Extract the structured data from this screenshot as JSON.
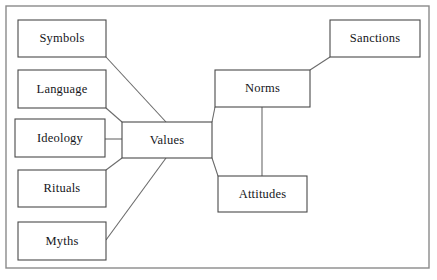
{
  "diagram": {
    "frame": {
      "name": "outer-border",
      "x": 6,
      "y": 6,
      "width": 423,
      "height": 262,
      "stroke": "#8a8a8a",
      "stroke_width": 1.4
    },
    "style": {
      "box_stroke": "#4a4a4a",
      "box_fill": "#ffffff",
      "box_stroke_width": 1.1,
      "connector_stroke": "#6b6b6b",
      "connector_stroke_width": 1.1,
      "text_color": "#15161a",
      "background": "#ffffff"
    },
    "nodes": [
      {
        "id": "symbols",
        "label": "Symbols",
        "x": 18,
        "y": 20,
        "width": 88,
        "height": 37
      },
      {
        "id": "language",
        "label": "Language",
        "x": 18,
        "y": 70,
        "width": 88,
        "height": 38
      },
      {
        "id": "ideology",
        "label": "Ideology",
        "x": 15,
        "y": 119,
        "width": 90,
        "height": 38
      },
      {
        "id": "rituals",
        "label": "Rituals",
        "x": 18,
        "y": 170,
        "width": 88,
        "height": 37
      },
      {
        "id": "myths",
        "label": "Myths",
        "x": 18,
        "y": 222,
        "width": 88,
        "height": 38
      },
      {
        "id": "values",
        "label": "Values",
        "x": 122,
        "y": 122,
        "width": 90,
        "height": 36
      },
      {
        "id": "norms",
        "label": "Norms",
        "x": 215,
        "y": 70,
        "width": 95,
        "height": 37
      },
      {
        "id": "sanctions",
        "label": "Sanctions",
        "x": 330,
        "y": 20,
        "width": 90,
        "height": 37
      },
      {
        "id": "attitudes",
        "label": "Attitudes",
        "x": 218,
        "y": 176,
        "width": 89,
        "height": 36
      }
    ],
    "connectors": [
      {
        "id": "symbols-to-values",
        "from": "symbols",
        "to": "values",
        "points": "106,57 166,122"
      },
      {
        "id": "language-to-values",
        "from": "language",
        "to": "values",
        "points": "106,108 122,122"
      },
      {
        "id": "ideology-to-values",
        "from": "ideology",
        "to": "values",
        "points": "105,139 122,139"
      },
      {
        "id": "rituals-to-values",
        "from": "rituals",
        "to": "values",
        "points": "106,170 122,158"
      },
      {
        "id": "myths-to-values",
        "from": "myths",
        "to": "values",
        "points": "106,240 166,158"
      },
      {
        "id": "values-to-norms",
        "from": "values",
        "to": "norms",
        "points": "212,122 215,107"
      },
      {
        "id": "values-to-attitudes",
        "from": "values",
        "to": "attitudes",
        "points": "212,158 218,176"
      },
      {
        "id": "norms-to-sanctions",
        "from": "norms",
        "to": "sanctions",
        "points": "310,70 330,57"
      },
      {
        "id": "norms-to-attitudes",
        "from": "norms",
        "to": "attitudes",
        "points": "262,107 262,176"
      }
    ]
  }
}
